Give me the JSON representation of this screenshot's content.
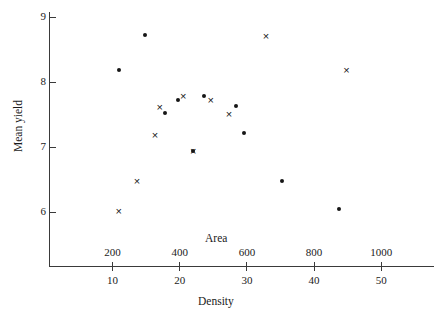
{
  "chart_data": {
    "type": "scatter",
    "title": "",
    "xlabel": "Density",
    "xlabel_secondary": "Area",
    "ylabel": "Mean yield",
    "ylim": [
      5.6,
      9.1
    ],
    "yticks": [
      6,
      7,
      8,
      9
    ],
    "ytick_labels": [
      "6",
      "7",
      "8",
      "9"
    ],
    "xlim_density": [
      5.0,
      55.5
    ],
    "xticks_density": [
      10,
      20,
      30,
      40,
      50
    ],
    "xtick_labels_density": [
      "10",
      "20",
      "30",
      "40",
      "50"
    ],
    "xlim_area": [
      100,
      1135
    ],
    "xticks_area": [
      200,
      400,
      600,
      800,
      1000
    ],
    "xtick_labels_area": [
      "200",
      "400",
      "600",
      "800",
      "1000"
    ],
    "grid": false,
    "legend": null,
    "series": [
      {
        "name": "dot",
        "marker": "filled-circle",
        "color": "#161616",
        "points": [
          {
            "density": 14.9,
            "area": 347,
            "yield": 8.72
          },
          {
            "density": 11.0,
            "area": 270,
            "yield": 8.19
          },
          {
            "density": 17.9,
            "area": 406,
            "yield": 7.52
          },
          {
            "density": 19.8,
            "area": 443,
            "yield": 7.72
          },
          {
            "density": 23.7,
            "area": 520,
            "yield": 7.79
          },
          {
            "density": 28.4,
            "area": 613,
            "yield": 7.63
          },
          {
            "density": 29.6,
            "area": 637,
            "yield": 7.22
          },
          {
            "density": 22.1,
            "area": 488,
            "yield": 6.94
          },
          {
            "density": 35.3,
            "area": 752,
            "yield": 6.47
          },
          {
            "density": 43.8,
            "area": 921,
            "yield": 6.04
          }
        ]
      },
      {
        "name": "cross",
        "marker": "x",
        "color": "#161616",
        "points": [
          {
            "density": 32.9,
            "area": 705,
            "yield": 8.71
          },
          {
            "density": 44.9,
            "area": 943,
            "yield": 8.19
          },
          {
            "density": 17.1,
            "area": 390,
            "yield": 7.61
          },
          {
            "density": 20.6,
            "area": 459,
            "yield": 7.78
          },
          {
            "density": 24.7,
            "area": 540,
            "yield": 7.73
          },
          {
            "density": 27.4,
            "area": 594,
            "yield": 7.51
          },
          {
            "density": 16.4,
            "area": 376,
            "yield": 7.18
          },
          {
            "density": 22.1,
            "area": 488,
            "yield": 6.94
          },
          {
            "density": 13.7,
            "area": 322,
            "yield": 6.47
          },
          {
            "density": 11.0,
            "area": 269,
            "yield": 6.02
          }
        ]
      }
    ]
  },
  "figure": {
    "ylabel": "Mean yield",
    "area_title": "Area",
    "density_title": "Density",
    "y_ticks": [
      {
        "value": 9,
        "label": "9"
      },
      {
        "value": 8,
        "label": "8"
      },
      {
        "value": 7,
        "label": "7"
      },
      {
        "value": 6,
        "label": "6"
      }
    ],
    "x_ticks": [
      {
        "area": 200,
        "area_label": "200",
        "density": 10,
        "density_label": "10"
      },
      {
        "area": 400,
        "area_label": "400",
        "density": 20,
        "density_label": "20"
      },
      {
        "area": 600,
        "area_label": "600",
        "density": 30,
        "density_label": "30"
      },
      {
        "area": 800,
        "area_label": "800",
        "density": 40,
        "density_label": "40"
      },
      {
        "area": 1000,
        "area_label": "1000",
        "density": 50,
        "density_label": "50"
      }
    ]
  }
}
